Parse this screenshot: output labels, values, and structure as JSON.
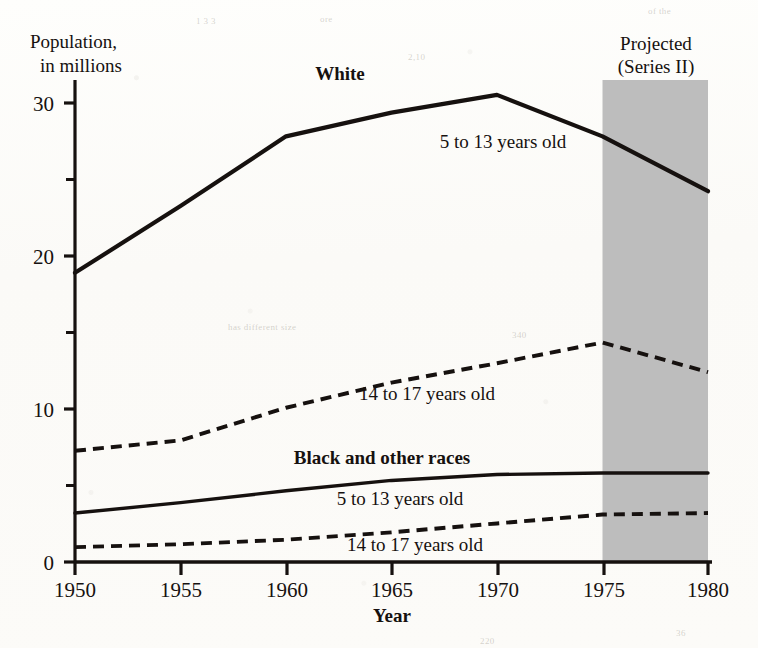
{
  "figure": {
    "background_color": "#fdfdfb",
    "ink_color": "#16110f",
    "projection_band_color": "#bdbdbd"
  },
  "axes": {
    "y_axis_title_line1": "Population,",
    "y_axis_title_line2": "in millions",
    "x_axis_title": "Year",
    "y_tick_labels": [
      "0",
      "10",
      "20",
      "30"
    ],
    "y_tick_values": [
      0,
      10,
      20,
      30
    ],
    "y_minor_tick_values": [
      5,
      15,
      25
    ],
    "x_tick_labels": [
      "1950",
      "1955",
      "1960",
      "1965",
      "1970",
      "1975",
      "1980"
    ],
    "x_tick_values": [
      1950,
      1955,
      1960,
      1965,
      1970,
      1975,
      1980
    ]
  },
  "annotations": {
    "group_white": "White",
    "group_black": "Black and other races",
    "white_5_13": "5 to 13 years old",
    "white_14_17": "14 to 17 years old",
    "black_5_13": "5 to 13 years old",
    "black_14_17": "14 to 17 years old",
    "projected_line1": "Projected",
    "projected_line2": "(Series II)"
  },
  "chart_data": {
    "type": "line",
    "title": "",
    "subtitle": "",
    "xlabel": "Year",
    "ylabel": "Population, in millions",
    "xlim": [
      1950,
      1980
    ],
    "ylim": [
      0,
      32.5
    ],
    "grid": false,
    "legend_position": "inline-annotations",
    "x": [
      1950,
      1955,
      1960,
      1965,
      1970,
      1975,
      1980
    ],
    "projection_band": {
      "label": "Projected (Series II)",
      "x_start": 1975,
      "x_end": 1980,
      "fill": "#bdbdbd"
    },
    "series": [
      {
        "name": "White, 5 to 13 years old",
        "group": "White",
        "age_group": "5 to 13 years old",
        "style": "solid",
        "values": [
          19.5,
          24.0,
          28.7,
          30.3,
          31.5,
          28.7,
          25.0
        ],
        "projected_from": 1975
      },
      {
        "name": "White, 14 to 17 years old",
        "group": "White",
        "age_group": "14 to 17 years old",
        "style": "dashed",
        "values": [
          7.5,
          8.2,
          10.4,
          12.1,
          13.4,
          14.8,
          12.8
        ],
        "projected_from": 1975
      },
      {
        "name": "Black and other races, 5 to 13 years old",
        "group": "Black and other races",
        "age_group": "5 to 13 years old",
        "style": "solid",
        "values": [
          3.3,
          4.0,
          4.8,
          5.5,
          5.9,
          6.0,
          6.0
        ],
        "projected_from": 1975
      },
      {
        "name": "Black and other races, 14 to 17 years old",
        "group": "Black and other races",
        "age_group": "14 to 17 years old",
        "style": "dashed",
        "values": [
          1.0,
          1.2,
          1.5,
          2.0,
          2.6,
          3.2,
          3.3
        ],
        "projected_from": 1975
      }
    ]
  },
  "scan_artifacts": [
    {
      "text": "of the",
      "x": 648,
      "y": 6
    },
    {
      "text": "1 3 3",
      "x": 196,
      "y": 16
    },
    {
      "text": "ore",
      "x": 320,
      "y": 14
    },
    {
      "text": "2,10",
      "x": 408,
      "y": 52
    },
    {
      "text": "has different size",
      "x": 228,
      "y": 322
    },
    {
      "text": "340",
      "x": 512,
      "y": 330
    },
    {
      "text": "220",
      "x": 480,
      "y": 636
    },
    {
      "text": "36",
      "x": 676,
      "y": 628
    }
  ]
}
